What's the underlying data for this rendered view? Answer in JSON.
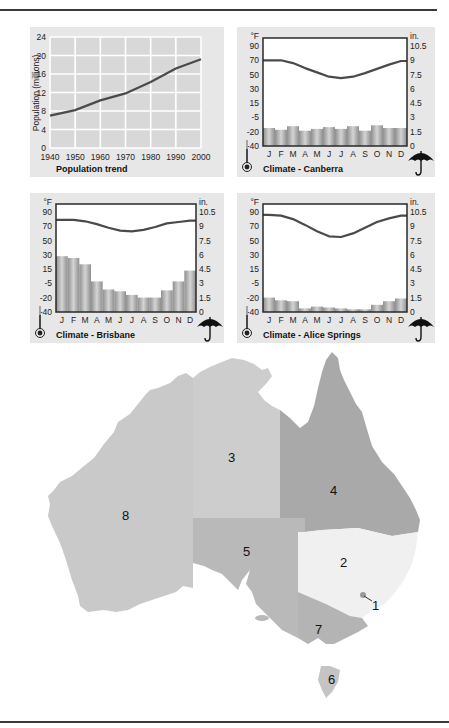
{
  "chart_data": [
    {
      "type": "line",
      "title": "Population trend",
      "xlabel": "",
      "ylabel": "Population (millions)",
      "x": [
        1940,
        1950,
        1960,
        1970,
        1980,
        1990,
        2000
      ],
      "values": [
        7.0,
        8.2,
        10.3,
        11.8,
        14.3,
        17.2,
        19.2
      ],
      "xticks": [
        "1940",
        "1950",
        "1960",
        "1970",
        "1980",
        "1990",
        "2000"
      ],
      "yticks": [
        "0",
        "4",
        "8",
        "12",
        "16",
        "20",
        "24"
      ],
      "ylim": [
        0,
        24
      ],
      "grid": true
    },
    {
      "type": "bar+line",
      "title": "Climate - Canberra",
      "categories": [
        "J",
        "F",
        "M",
        "A",
        "M",
        "J",
        "J",
        "A",
        "S",
        "O",
        "N",
        "D"
      ],
      "left_unit": "°F",
      "right_unit": "in.",
      "left_ticks": [
        "90",
        "70",
        "50",
        "30",
        "15",
        "-5",
        "-20",
        "-40"
      ],
      "right_ticks": [
        "10.5",
        "9",
        "7.5",
        "6",
        "4.5",
        "3",
        "1.5",
        "0"
      ],
      "series": [
        {
          "name": "Temperature (°F)",
          "type": "line",
          "values": [
            70,
            70,
            66,
            59,
            53,
            47,
            45,
            47,
            52,
            58,
            64,
            69
          ]
        },
        {
          "name": "Rainfall (in.)",
          "type": "bar",
          "values": [
            2.0,
            1.8,
            2.2,
            1.7,
            1.9,
            2.1,
            1.9,
            2.2,
            1.7,
            2.3,
            2.0,
            2.0
          ]
        }
      ]
    },
    {
      "type": "bar+line",
      "title": "Climate - Brisbane",
      "categories": [
        "J",
        "F",
        "M",
        "A",
        "M",
        "J",
        "J",
        "A",
        "S",
        "O",
        "N",
        "D"
      ],
      "left_unit": "°F",
      "right_unit": "in.",
      "left_ticks": [
        "90",
        "70",
        "50",
        "30",
        "15",
        "-5",
        "-20",
        "-40"
      ],
      "right_ticks": [
        "10.5",
        "9",
        "7.5",
        "6",
        "4.5",
        "3",
        "1.5",
        "0"
      ],
      "series": [
        {
          "name": "Temperature (°F)",
          "type": "line",
          "values": [
            79,
            79,
            77,
            73,
            68,
            64,
            63,
            65,
            69,
            74,
            76,
            78
          ]
        },
        {
          "name": "Rainfall (in.)",
          "type": "bar",
          "values": [
            6.2,
            6.0,
            5.3,
            3.4,
            2.5,
            2.3,
            1.9,
            1.6,
            1.6,
            2.4,
            3.4,
            4.6
          ]
        }
      ]
    },
    {
      "type": "bar+line",
      "title": "Climate - Alice Springs",
      "categories": [
        "J",
        "F",
        "M",
        "A",
        "M",
        "J",
        "J",
        "A",
        "S",
        "O",
        "N",
        "D"
      ],
      "left_unit": "°F",
      "right_unit": "in.",
      "left_ticks": [
        "90",
        "70",
        "50",
        "30",
        "15",
        "-5",
        "-20",
        "-40"
      ],
      "right_ticks": [
        "10.5",
        "9",
        "7.5",
        "6",
        "4.5",
        "3",
        "1.5",
        "0"
      ],
      "series": [
        {
          "name": "Temperature (°F)",
          "type": "line",
          "values": [
            86,
            85,
            80,
            72,
            63,
            56,
            55,
            60,
            68,
            76,
            81,
            85
          ]
        },
        {
          "name": "Rainfall (in.)",
          "type": "bar",
          "values": [
            1.6,
            1.3,
            1.2,
            0.4,
            0.6,
            0.5,
            0.4,
            0.3,
            0.3,
            0.8,
            1.2,
            1.5
          ]
        }
      ]
    }
  ],
  "population": {
    "title": "Population trend",
    "ylabel": "Population (millions)",
    "yticks": [
      "0",
      "4",
      "8",
      "12",
      "16",
      "20",
      "24"
    ],
    "xticks": [
      "1940",
      "1950",
      "1960",
      "1970",
      "1980",
      "1990",
      "2000"
    ]
  },
  "climate": {
    "months": [
      "J",
      "F",
      "M",
      "A",
      "M",
      "J",
      "J",
      "A",
      "S",
      "O",
      "N",
      "D"
    ],
    "left_unit": "°F",
    "right_unit": "in.",
    "left_ticks": [
      "90",
      "70",
      "50",
      "30",
      "15",
      "-5",
      "-20",
      "-40"
    ],
    "right_ticks": [
      "10.5",
      "9",
      "7.5",
      "6",
      "4.5",
      "3",
      "1.5",
      "0"
    ],
    "canberra": {
      "title": "Climate - Canberra"
    },
    "brisbane": {
      "title": "Climate - Brisbane"
    },
    "alice": {
      "title": "Climate - Alice Springs"
    }
  },
  "map": {
    "labels": {
      "act": "1",
      "nsw": "2",
      "nt": "3",
      "qld": "4",
      "sa": "5",
      "tas": "6",
      "vic": "7",
      "wa": "8"
    },
    "colors": {
      "wa": "#c9c9c9",
      "nt": "#cdcdcd",
      "qld": "#a9a9a9",
      "sa": "#b9b9b9",
      "nsw": "#f0f0f0",
      "vic": "#b4b4b4",
      "tas": "#c4c4c4",
      "act": "#9a9a9a"
    }
  },
  "colors": {
    "panel_bg": "#e7e7e7",
    "line": "#4a4a4a",
    "bar": "#a8a8a8",
    "grid": "#ffffff"
  }
}
